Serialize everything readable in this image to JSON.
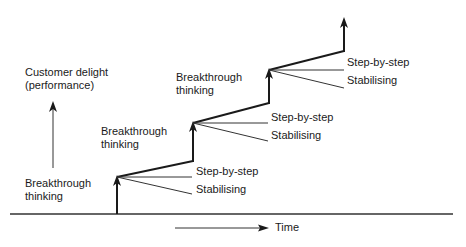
{
  "diagram": {
    "y_axis_label_line1": "Customer delight",
    "y_axis_label_line2": "(performance)",
    "x_axis_label": "Time",
    "stages": [
      {
        "breakthrough_line1": "Breakthrough",
        "breakthrough_line2": "thinking",
        "step_label": "Step-by-step",
        "stabilise_label": "Stabilising"
      },
      {
        "breakthrough_line1": "Breakthrough",
        "breakthrough_line2": "thinking",
        "step_label": "Step-by-step",
        "stabilise_label": "Stabilising"
      },
      {
        "breakthrough_line1": "Breakthrough",
        "breakthrough_line2": "thinking",
        "step_label": "Step-by-step",
        "stabilise_label": "Stabilising"
      }
    ],
    "colors": {
      "line": "#1a1a1a",
      "background": "#ffffff"
    }
  }
}
